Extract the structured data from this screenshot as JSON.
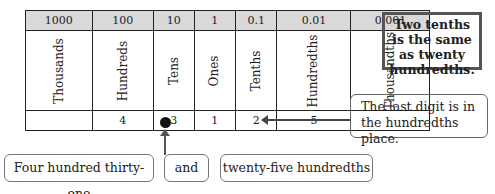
{
  "place_value_table": {
    "headers": [
      "1000",
      "100",
      "10",
      "1",
      "0.1",
      "0.01",
      "0.001"
    ],
    "names": [
      "Thousands",
      "Hundreds",
      "Tens",
      "Ones",
      "Tenths",
      "Hundredths",
      "Thousandths"
    ],
    "values": [
      "",
      "4",
      "3",
      "1",
      "2",
      "5",
      ""
    ]
  },
  "notes": {
    "boxed": "Two tenths is the same as twenty hundredths.",
    "last_digit": "The last digit is in the hundredths place."
  },
  "labels": {
    "whole": "Four hundred thirty-one",
    "and": "and",
    "fraction": "twenty-five hundredths"
  },
  "colors": {
    "header_bg": "#d9d9d9",
    "border": "#222222"
  }
}
